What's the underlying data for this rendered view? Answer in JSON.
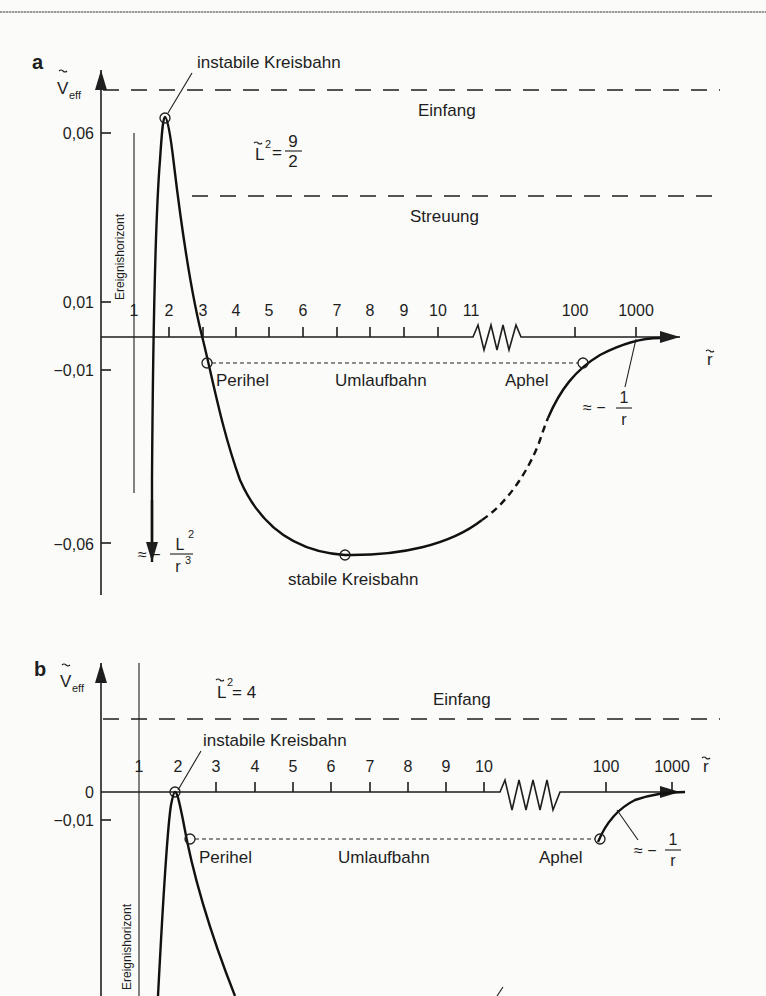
{
  "figure": {
    "panels": [
      {
        "id": "a",
        "label": "a",
        "y_axis_label": "V",
        "y_axis_sub": "eff",
        "x_axis_label": "r",
        "L2_label": "L",
        "L2_sup": "2",
        "L2_eq": "=",
        "L2_num": "9",
        "L2_den": "2",
        "y_ticks": [
          "0,06",
          "0,01",
          "−0,01",
          "−0,06"
        ],
        "x_ticks": [
          "1",
          "2",
          "3",
          "4",
          "5",
          "6",
          "7",
          "8",
          "9",
          "10",
          "11",
          "100",
          "1000"
        ],
        "annotations": {
          "unstable_orbit": "instabile Kreisbahn",
          "capture": "Einfang",
          "scattering": "Streuung",
          "event_horizon": "Ereignishorizont",
          "perihel": "Perihel",
          "orbit": "Umlaufbahn",
          "aphel": "Aphel",
          "stable_orbit": "stabile Kreisbahn",
          "asym_far_prefix": "≈ −",
          "asym_far_num": "1",
          "asym_far_den": "r",
          "asym_near_prefix": "≈ −",
          "asym_near_num": "L",
          "asym_near_num_sup": "2",
          "asym_near_den": "r",
          "asym_near_den_sup": "3"
        }
      },
      {
        "id": "b",
        "label": "b",
        "y_axis_label": "V",
        "y_axis_sub": "eff",
        "x_axis_label": "r",
        "L2_label": "L",
        "L2_sup": "2",
        "L2_eq": "= 4",
        "y_ticks": [
          "0",
          "−0,01"
        ],
        "x_ticks": [
          "1",
          "2",
          "3",
          "4",
          "5",
          "6",
          "7",
          "8",
          "9",
          "10",
          "100",
          "1000"
        ],
        "annotations": {
          "capture": "Einfang",
          "unstable_orbit": "instabile Kreisbahn",
          "event_horizon": "Ereignishorizont",
          "perihel": "Perihel",
          "orbit": "Umlaufbahn",
          "aphel": "Aphel",
          "asym_far_prefix": "≈ −",
          "asym_far_num": "1",
          "asym_far_den": "r"
        }
      }
    ]
  }
}
